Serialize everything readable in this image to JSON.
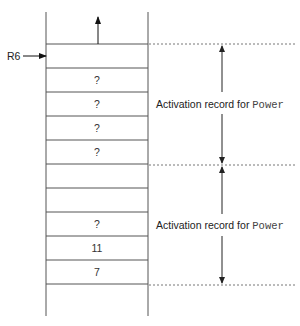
{
  "diagram": {
    "type": "run-time stack",
    "pointer": {
      "label": "R6",
      "points_to_row": 0
    },
    "top_arrow": "up",
    "rows": [
      {
        "value": ""
      },
      {
        "value": "?"
      },
      {
        "value": "?"
      },
      {
        "value": "?"
      },
      {
        "value": "?"
      },
      {
        "value": ""
      },
      {
        "value": ""
      },
      {
        "value": "?"
      },
      {
        "value": "11"
      },
      {
        "value": "7"
      }
    ],
    "brackets": [
      {
        "label_prefix": "Activation record for ",
        "label_code": "Power",
        "from_row": 0,
        "to_row": 4
      },
      {
        "label_prefix": "Activation record for ",
        "label_code": "Power",
        "from_row": 5,
        "to_row": 9
      }
    ]
  }
}
